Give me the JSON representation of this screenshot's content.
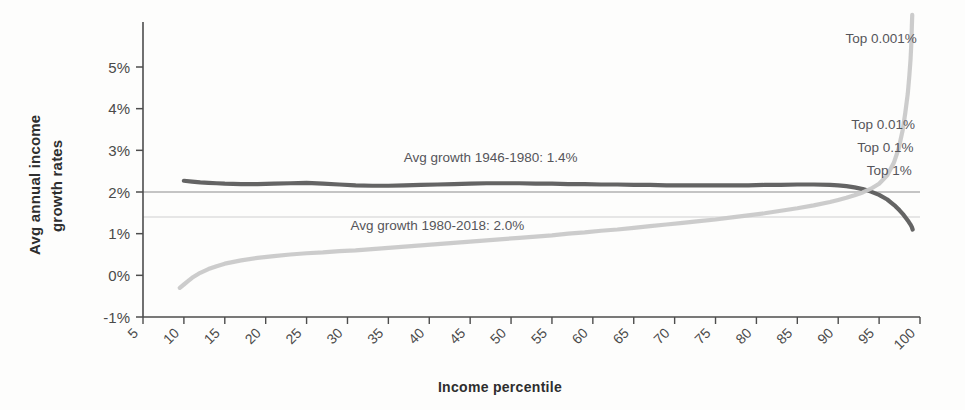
{
  "chart_data": {
    "type": "line",
    "title": "",
    "xlabel": "Income percentile",
    "ylabel_line1": "Avg annual income",
    "ylabel_line2": "growth rates",
    "xlim": [
      5,
      100
    ],
    "ylim": [
      -1,
      6
    ],
    "grid": false,
    "legend_position": "none",
    "xticks": [
      5,
      10,
      15,
      20,
      25,
      30,
      35,
      40,
      45,
      50,
      55,
      60,
      65,
      70,
      75,
      80,
      85,
      90,
      95,
      100
    ],
    "xtick_labels": [
      "5",
      "10",
      "15",
      "20",
      "25",
      "30",
      "35",
      "40",
      "45",
      "50",
      "55",
      "60",
      "65",
      "70",
      "75",
      "80",
      "85",
      "90",
      "95",
      "100"
    ],
    "yticks": [
      -1,
      0,
      1,
      2,
      3,
      4,
      5
    ],
    "ytick_labels": [
      "-1%",
      "0%",
      "1%",
      "2%",
      "3%",
      "4%",
      "5%"
    ],
    "series": [
      {
        "name": "1946-1980 growth",
        "color": "#5c5c5c",
        "x": [
          10,
          11,
          12,
          13,
          14,
          15,
          17,
          19,
          21,
          23,
          25,
          27,
          29,
          31,
          33,
          35,
          37,
          39,
          41,
          43,
          45,
          47,
          49,
          51,
          53,
          55,
          57,
          59,
          61,
          63,
          65,
          67,
          69,
          71,
          73,
          75,
          77,
          79,
          81,
          83,
          85,
          87,
          89,
          90,
          91,
          92,
          93,
          94,
          95,
          96,
          96.5,
          97,
          97.5,
          98,
          98.3,
          98.6,
          98.8,
          99,
          99.1
        ],
        "y": [
          2.27,
          2.25,
          2.23,
          2.22,
          2.21,
          2.2,
          2.19,
          2.19,
          2.2,
          2.21,
          2.22,
          2.2,
          2.18,
          2.16,
          2.15,
          2.15,
          2.16,
          2.17,
          2.18,
          2.19,
          2.2,
          2.21,
          2.21,
          2.21,
          2.2,
          2.2,
          2.19,
          2.19,
          2.18,
          2.18,
          2.17,
          2.17,
          2.16,
          2.16,
          2.16,
          2.16,
          2.16,
          2.16,
          2.17,
          2.17,
          2.18,
          2.18,
          2.17,
          2.16,
          2.14,
          2.11,
          2.07,
          2.01,
          1.93,
          1.82,
          1.74,
          1.66,
          1.56,
          1.45,
          1.37,
          1.29,
          1.23,
          1.16,
          1.1
        ]
      },
      {
        "name": "1980-2018 growth",
        "color": "#c9c9c9",
        "x": [
          9.5,
          10,
          10.5,
          11,
          12,
          13,
          14,
          15,
          17,
          19,
          21,
          23,
          25,
          27,
          29,
          31,
          33,
          35,
          37,
          39,
          41,
          43,
          45,
          47,
          49,
          51,
          53,
          55,
          57,
          59,
          61,
          63,
          65,
          67,
          69,
          71,
          73,
          75,
          77,
          79,
          81,
          83,
          85,
          87,
          89,
          90,
          91,
          92,
          93,
          94,
          95,
          96,
          96.8,
          97.4,
          97.9,
          98.2,
          98.5,
          98.7,
          98.85,
          98.95,
          99.0,
          99.05
        ],
        "y": [
          -0.3,
          -0.22,
          -0.14,
          -0.06,
          0.06,
          0.15,
          0.22,
          0.28,
          0.36,
          0.42,
          0.46,
          0.5,
          0.53,
          0.55,
          0.58,
          0.6,
          0.63,
          0.66,
          0.69,
          0.72,
          0.75,
          0.78,
          0.81,
          0.84,
          0.87,
          0.9,
          0.93,
          0.96,
          1.0,
          1.03,
          1.07,
          1.1,
          1.14,
          1.18,
          1.22,
          1.26,
          1.3,
          1.34,
          1.39,
          1.44,
          1.49,
          1.55,
          1.61,
          1.68,
          1.76,
          1.81,
          1.86,
          1.92,
          1.99,
          2.08,
          2.2,
          2.4,
          2.7,
          3.05,
          3.5,
          3.9,
          4.35,
          4.8,
          5.2,
          5.6,
          5.95,
          6.25
        ]
      }
    ],
    "reference_lines": [
      {
        "name": "avg-1980-2018",
        "value": 2.0,
        "color": "#8c8c8c",
        "label": "Avg growth 1946-1980: 1.4%"
      },
      {
        "name": "avg-1946-1980",
        "value": 1.4,
        "color": "#cfcfcf",
        "label": "Avg growth 1980-2018: 2.0%"
      }
    ],
    "annotations": [
      {
        "name": "avg-growth-upper",
        "text": "Avg growth 1946-1980: 1.4%",
        "x": 47.5,
        "y": 2.72
      },
      {
        "name": "avg-growth-lower",
        "text": "Avg growth 1980-2018: 2.0%",
        "x": 41.0,
        "y": 1.1
      },
      {
        "name": "top-0-001",
        "text": "Top 0.001%",
        "x": 99.6,
        "y": 5.58
      },
      {
        "name": "top-0-01",
        "text": "Top 0.01%",
        "x": 99.4,
        "y": 3.52
      },
      {
        "name": "top-0-1",
        "text": "Top 0.1%",
        "x": 99.2,
        "y": 2.95
      },
      {
        "name": "top-1",
        "text": "Top 1%",
        "x": 99.0,
        "y": 2.4
      }
    ]
  }
}
